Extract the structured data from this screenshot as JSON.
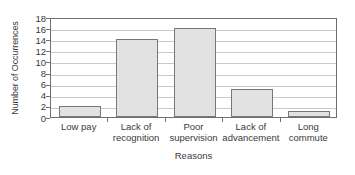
{
  "chart_data": {
    "type": "bar",
    "title": "",
    "xlabel": "Reasons",
    "ylabel": "Number of Occurrences",
    "categories": [
      "Low pay",
      "Lack of recognition",
      "Poor supervision",
      "Lack of advancement",
      "Long commute"
    ],
    "category_lines": [
      [
        "Low pay"
      ],
      [
        "Lack of",
        "recognition"
      ],
      [
        "Poor",
        "supervision"
      ],
      [
        "Lack of",
        "advancement"
      ],
      [
        "Long",
        "commute"
      ]
    ],
    "values": [
      2,
      14,
      16,
      5,
      1
    ],
    "ylim": [
      0,
      18
    ],
    "ytick_step": 2,
    "yticks": [
      0,
      2,
      4,
      6,
      8,
      10,
      12,
      14,
      16,
      18
    ],
    "ytick_labels": [
      "0",
      "2",
      "4",
      "6",
      "8",
      "10",
      "12",
      "14",
      "16",
      "18"
    ],
    "grid": true,
    "grid_axis": "y",
    "legend": false,
    "legend_position": "none",
    "bar_fill_color": "#e2e2e2",
    "bar_edge_color": "#777777",
    "gridline_color": "#c9c9c9",
    "axis_color": "#6f6f6f",
    "text_color": "#3a3a3a",
    "background_color": "#ffffff"
  }
}
